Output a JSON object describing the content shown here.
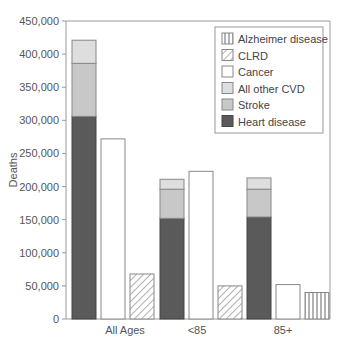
{
  "chart_data": {
    "type": "bar",
    "title": "",
    "xlabel": "",
    "ylabel": "Deaths",
    "ylim": [
      0,
      450000
    ],
    "yticks": [
      0,
      50000,
      100000,
      150000,
      200000,
      250000,
      300000,
      350000,
      400000,
      450000
    ],
    "ytick_labels": [
      "0",
      "50,000",
      "100,000",
      "150,000",
      "200,000",
      "250,000",
      "300,000",
      "350,000",
      "400,000",
      "450,000"
    ],
    "grid": false,
    "legend_position": "upper right",
    "categories": [
      "All Ages",
      "<85",
      "85+"
    ],
    "legend": [
      "Alzheimer disease",
      "CLRD",
      "Cancer",
      "All other CVD",
      "Stroke",
      "Heart disease"
    ],
    "groups": [
      {
        "category": "All Ages",
        "bars": [
          {
            "type": "stacked",
            "segments": [
              {
                "name": "Heart disease",
                "value": 306000
              },
              {
                "name": "Stroke",
                "value": 80000
              },
              {
                "name": "All other CVD",
                "value": 35000
              }
            ],
            "total": 421000
          },
          {
            "name": "Cancer",
            "value": 272000
          },
          {
            "name": "CLRD",
            "value": 68000
          }
        ]
      },
      {
        "category": "<85",
        "bars": [
          {
            "type": "stacked",
            "segments": [
              {
                "name": "Heart disease",
                "value": 152000
              },
              {
                "name": "Stroke",
                "value": 44000
              },
              {
                "name": "All other CVD",
                "value": 15000
              }
            ],
            "total": 211000
          },
          {
            "name": "Cancer",
            "value": 223000
          },
          {
            "name": "CLRD",
            "value": 50000
          }
        ]
      },
      {
        "category": "85+",
        "bars": [
          {
            "type": "stacked",
            "segments": [
              {
                "name": "Heart disease",
                "value": 154000
              },
              {
                "name": "Stroke",
                "value": 42000
              },
              {
                "name": "All other CVD",
                "value": 17000
              }
            ],
            "total": 213000
          },
          {
            "name": "Cancer",
            "value": 52000
          },
          {
            "name": "Alzheimer disease",
            "value": 40000
          }
        ]
      }
    ],
    "series": [
      {
        "name": "Heart disease",
        "values": [
          306000,
          152000,
          154000
        ]
      },
      {
        "name": "Stroke",
        "values": [
          80000,
          44000,
          42000
        ]
      },
      {
        "name": "All other CVD",
        "values": [
          35000,
          15000,
          17000
        ]
      },
      {
        "name": "Cancer",
        "values": [
          272000,
          223000,
          52000
        ]
      },
      {
        "name": "CLRD",
        "values": [
          68000,
          50000,
          null
        ]
      },
      {
        "name": "Alzheimer disease",
        "values": [
          null,
          null,
          40000
        ]
      }
    ],
    "colors": {
      "Heart disease": "#5a5a5a",
      "Stroke": "#c8c8c8",
      "All other CVD": "#dedede",
      "Cancer": "#ffffff",
      "CLRD": "hatch-diagonal",
      "Alzheimer disease": "hatch-vertical"
    }
  }
}
